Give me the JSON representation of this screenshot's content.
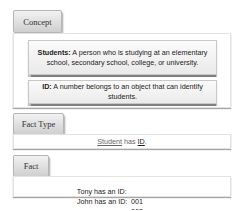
{
  "concept": {
    "tab_label": "Concept",
    "definitions": [
      {
        "term": "Students:",
        "text": " A person who is studying at an elementary school, secondary school, college, or university."
      },
      {
        "term": "ID:",
        "text": "  A number belongs to an object that can identify students."
      }
    ]
  },
  "fact_type": {
    "tab_label": "Fact Type",
    "subject": "Student",
    "verb": " has ",
    "object": "ID",
    "terminator": "."
  },
  "fact": {
    "tab_label": "Fact",
    "lines": [
      {
        "text": "Tony has an ID:",
        "value": "001"
      },
      {
        "text": "John has an ID:",
        "value": "002"
      }
    ]
  }
}
